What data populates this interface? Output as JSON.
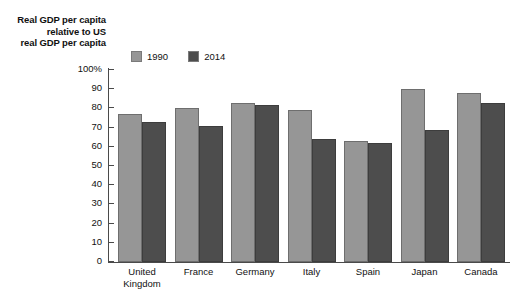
{
  "chart_data": {
    "type": "bar",
    "title": "",
    "ylabel": "Real GDP per capita\nrelative to US\nreal GDP per capita",
    "xlabel": "",
    "categories": [
      "United\nKingdom",
      "France",
      "Germany",
      "Italy",
      "Spain",
      "Japan",
      "Canada"
    ],
    "series": [
      {
        "name": "1990",
        "color": "#969696",
        "values": [
          77,
          80,
          83,
          79,
          63,
          90,
          88
        ]
      },
      {
        "name": "2014",
        "color": "#4d4d4d",
        "values": [
          73,
          71,
          82,
          64,
          62,
          69,
          83
        ]
      }
    ],
    "ylim": [
      0,
      100
    ],
    "yticks": [
      0,
      10,
      20,
      30,
      40,
      50,
      60,
      70,
      80,
      90,
      100
    ],
    "ytick_labels": [
      "0",
      "10",
      "20",
      "30",
      "40",
      "50",
      "60",
      "70",
      "80",
      "90",
      "100%"
    ],
    "grid": false,
    "legend_position": "top-left-inside"
  },
  "axis": {
    "y_title": "Real GDP per capita\nrelative to US\nreal GDP per capita"
  },
  "legend": {
    "entries": [
      {
        "label": "1990",
        "color": "#969696"
      },
      {
        "label": "2014",
        "color": "#4d4d4d"
      }
    ]
  }
}
